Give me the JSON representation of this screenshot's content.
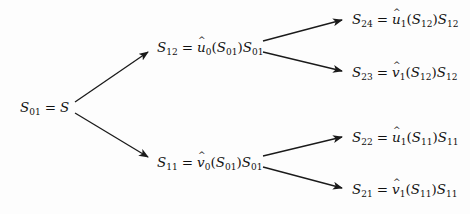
{
  "diagram": {
    "type": "binomial-tree",
    "colors": {
      "line": "#1a1a1a",
      "text": "#111111",
      "background": "#fdfdfd"
    },
    "nodes": [
      {
        "id": "S01",
        "level": 0,
        "lhs": "S",
        "lhs_sub": "01",
        "rhs_text": "S",
        "x": 20,
        "y": 107,
        "latex": "S_{01} = S"
      },
      {
        "id": "S12",
        "level": 1,
        "lhs": "S",
        "lhs_sub": "12",
        "fn": "u",
        "fn_sub": "0",
        "arg": "S",
        "arg_sub": "01",
        "mult": "S",
        "mult_sub": "01",
        "x": 157,
        "y": 47,
        "latex": "S_{12} = \\hat{u}_0(S_{01})S_{01}"
      },
      {
        "id": "S11",
        "level": 1,
        "lhs": "S",
        "lhs_sub": "11",
        "fn": "v",
        "fn_sub": "0",
        "arg": "S",
        "arg_sub": "01",
        "mult": "S",
        "mult_sub": "01",
        "x": 157,
        "y": 162,
        "latex": "S_{11} = \\hat{v}_0(S_{01})S_{01}"
      },
      {
        "id": "S24",
        "level": 2,
        "lhs": "S",
        "lhs_sub": "24",
        "fn": "u",
        "fn_sub": "1",
        "arg": "S",
        "arg_sub": "12",
        "mult": "S",
        "mult_sub": "12",
        "x": 352,
        "y": 19,
        "latex": "S_{24} = \\hat{u}_1(S_{12})S_{12}"
      },
      {
        "id": "S23",
        "level": 2,
        "lhs": "S",
        "lhs_sub": "23",
        "fn": "v",
        "fn_sub": "1",
        "arg": "S",
        "arg_sub": "12",
        "mult": "S",
        "mult_sub": "12",
        "x": 352,
        "y": 72,
        "latex": "S_{23} = \\hat{v}_1(S_{12})S_{12}"
      },
      {
        "id": "S22",
        "level": 2,
        "lhs": "S",
        "lhs_sub": "22",
        "fn": "u",
        "fn_sub": "1",
        "arg": "S",
        "arg_sub": "11",
        "mult": "S",
        "mult_sub": "11",
        "x": 352,
        "y": 137,
        "latex": "S_{22} = \\hat{u}_1(S_{11})S_{11}"
      },
      {
        "id": "S21",
        "level": 2,
        "lhs": "S",
        "lhs_sub": "21",
        "fn": "v",
        "fn_sub": "1",
        "arg": "S",
        "arg_sub": "11",
        "mult": "S",
        "mult_sub": "11",
        "x": 352,
        "y": 189,
        "latex": "S_{21} = \\hat{v}_1(S_{11})S_{11}"
      }
    ],
    "edges": [
      {
        "from": "S01",
        "to": "S12",
        "x1": 75,
        "y1": 102,
        "x2": 148,
        "y2": 52
      },
      {
        "from": "S01",
        "to": "S11",
        "x1": 75,
        "y1": 113,
        "x2": 148,
        "y2": 157
      },
      {
        "from": "S12",
        "to": "S24",
        "x1": 263,
        "y1": 41,
        "x2": 342,
        "y2": 20
      },
      {
        "from": "S12",
        "to": "S23",
        "x1": 263,
        "y1": 52,
        "x2": 342,
        "y2": 71
      },
      {
        "from": "S11",
        "to": "S22",
        "x1": 263,
        "y1": 156,
        "x2": 342,
        "y2": 137
      },
      {
        "from": "S11",
        "to": "S21",
        "x1": 263,
        "y1": 167,
        "x2": 342,
        "y2": 188
      }
    ],
    "equals": "="
  }
}
